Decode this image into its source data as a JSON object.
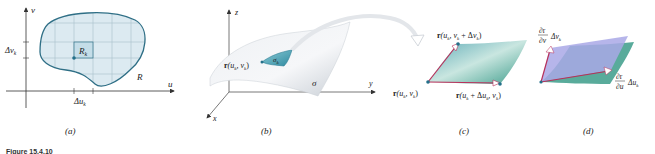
{
  "figure": {
    "caption": "Figure 15.4.10",
    "panels": [
      {
        "id": "a",
        "label": "(a)",
        "description": "Region R in the uv-plane subdivided by a grid; one subrectangle R_k highlighted",
        "axes": {
          "horizontal": "u",
          "vertical": "v"
        },
        "labels": {
          "region": "R",
          "subrectangle": "R",
          "subrectangle_sub": "k",
          "delta_u": "Δu",
          "delta_u_sub": "k",
          "delta_v": "Δv",
          "delta_v_sub": "k"
        }
      },
      {
        "id": "b",
        "label": "(b)",
        "description": "Surface σ in xyz-space with patch σ_k at r(u_k, v_k)",
        "axes": {
          "x": "x",
          "y": "y",
          "z": "z"
        },
        "labels": {
          "surface": "σ",
          "patch": "σ",
          "patch_sub": "k",
          "point_prefix": "r",
          "point_args": "(u",
          "point_args_sub1": "k",
          "point_mid": ", v",
          "point_args_sub2": "k",
          "point_close": ")"
        }
      },
      {
        "id": "c",
        "label": "(c)",
        "description": "Enlarged curved patch with corner points",
        "labels": {
          "corner_origin": "r(u_k, v_k)",
          "corner_top": "r(u_k, v_k + Δv_k)",
          "corner_right": "r(u_k + Δu_k, v_k)"
        }
      },
      {
        "id": "d",
        "label": "(d)",
        "description": "Tangent-vector parallelogram approximating the patch",
        "labels": {
          "vector_v_num": "∂r",
          "vector_v_den": "∂v",
          "vector_v_factor": "Δv",
          "vector_v_sub": "k",
          "vector_u_num": "∂r",
          "vector_u_den": "∂u",
          "vector_u_factor": "Δu",
          "vector_u_sub": "k"
        }
      }
    ],
    "colors": {
      "region_fill": "#dceaf1",
      "region_stroke": "#2f6f86",
      "grid": "#a9bfca",
      "highlight_fill": "#c4dde8",
      "point": "#24708a",
      "surface_light": "#f2f4f6",
      "surface_shade": "#c9cfd6",
      "patch_teal": "#4fa3b5",
      "patch_green": "#3c9c8a",
      "vector_red": "#b8305a",
      "parallelogram": "#a9a8e6",
      "axis": "#333333"
    }
  }
}
